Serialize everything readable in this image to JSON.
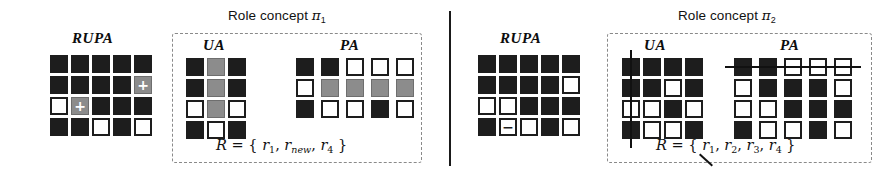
{
  "figure": {
    "title_prefix": "Role concept",
    "divider": "vertical-separator"
  },
  "colors": {
    "dark_cell": "#1d1d1d",
    "gray_cell": "#8c8c8c",
    "white_cell": "#ffffff",
    "dashed_border": "#8a8a8a",
    "strike_line": "#111111"
  },
  "panels": [
    {
      "id": "panel-1",
      "title": "Role concept",
      "title_symbol": "π",
      "title_subscript": "1",
      "rupa": {
        "label": "RUPA",
        "rows": 4,
        "cols": 5,
        "cells": [
          [
            "dark",
            "dark",
            "dark",
            "dark",
            "dark"
          ],
          [
            "dark",
            "dark",
            "dark",
            "dark",
            "gray"
          ],
          [
            "white",
            "gray",
            "dark",
            "dark",
            "dark"
          ],
          [
            "dark",
            "dark",
            "white",
            "dark",
            "white"
          ]
        ],
        "marks": [
          [
            "",
            "",
            "",
            "",
            ""
          ],
          [
            "",
            "",
            "",
            "",
            "+"
          ],
          [
            "",
            "+",
            "",
            "",
            ""
          ],
          [
            "",
            "",
            "",
            "",
            ""
          ]
        ]
      },
      "ua": {
        "label": "UA",
        "rows": 4,
        "cols": 3,
        "cells": [
          [
            "dark",
            "gray",
            "dark"
          ],
          [
            "dark",
            "gray",
            "dark"
          ],
          [
            "white",
            "gray",
            "white"
          ],
          [
            "dark",
            "white",
            "dark"
          ]
        ],
        "strike": "none"
      },
      "pa": {
        "label": "PA",
        "rows": 3,
        "cols": 5,
        "cells": [
          [
            "dark",
            "dark",
            "white",
            "white",
            "white"
          ],
          [
            "white",
            "gray",
            "gray",
            "gray",
            "gray"
          ],
          [
            "dark",
            "white",
            "white",
            "dark",
            "white"
          ]
        ],
        "strike": "none"
      },
      "formula": {
        "lhs": "R",
        "eq": "=",
        "open": "{",
        "close": "}",
        "items": [
          {
            "base": "r",
            "sub": "1",
            "sub_italic": false,
            "struck": false
          },
          {
            "base": "r",
            "sub": "new",
            "sub_italic": true,
            "struck": false
          },
          {
            "base": "r",
            "sub": "4",
            "sub_italic": false,
            "struck": false
          }
        ]
      }
    },
    {
      "id": "panel-2",
      "title": "Role concept",
      "title_symbol": "π",
      "title_subscript": "2",
      "rupa": {
        "label": "RUPA",
        "rows": 4,
        "cols": 5,
        "cells": [
          [
            "dark",
            "dark",
            "dark",
            "dark",
            "dark"
          ],
          [
            "dark",
            "dark",
            "dark",
            "dark",
            "white"
          ],
          [
            "white",
            "white",
            "dark",
            "dark",
            "dark"
          ],
          [
            "dark",
            "white",
            "white",
            "dark",
            "white"
          ]
        ],
        "marks": [
          [
            "",
            "",
            "",
            "",
            ""
          ],
          [
            "",
            "",
            "",
            "",
            ""
          ],
          [
            "",
            "",
            "",
            "",
            ""
          ],
          [
            "",
            "−",
            "",
            "",
            ""
          ]
        ]
      },
      "ua": {
        "label": "UA",
        "rows": 4,
        "cols": 4,
        "cells": [
          [
            "dark",
            "dark",
            "dark",
            "dark"
          ],
          [
            "dark",
            "dark",
            "white",
            "dark"
          ],
          [
            "white",
            "white",
            "dark",
            "white"
          ],
          [
            "dark",
            "white",
            "white",
            "dark"
          ]
        ],
        "strike": "vertical-column-1"
      },
      "pa": {
        "label": "PA",
        "rows": 4,
        "cols": 5,
        "cells": [
          [
            "dark",
            "dark",
            "white",
            "white",
            "white"
          ],
          [
            "white",
            "dark",
            "dark",
            "dark",
            "white"
          ],
          [
            "white",
            "white",
            "dark",
            "dark",
            "dark"
          ],
          [
            "dark",
            "white",
            "white",
            "dark",
            "white"
          ]
        ],
        "strike": "horizontal-row-1"
      },
      "formula": {
        "lhs": "R",
        "eq": "=",
        "open": "{",
        "close": "}",
        "items": [
          {
            "base": "r",
            "sub": "1",
            "sub_italic": false,
            "struck": true
          },
          {
            "base": "r",
            "sub": "2",
            "sub_italic": false,
            "struck": false
          },
          {
            "base": "r",
            "sub": "3",
            "sub_italic": false,
            "struck": false
          },
          {
            "base": "r",
            "sub": "4",
            "sub_italic": false,
            "struck": false
          }
        ]
      }
    }
  ]
}
